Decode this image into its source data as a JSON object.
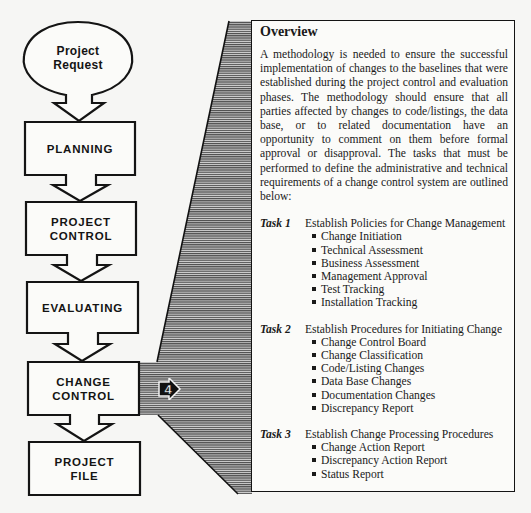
{
  "flowchart": {
    "start": {
      "label_line1": "Project",
      "label_line2": "Request"
    },
    "steps": [
      {
        "line1": "PLANNING",
        "line2": ""
      },
      {
        "line1": "PROJECT",
        "line2": "CONTROL"
      },
      {
        "line1": "EVALUATING",
        "line2": ""
      },
      {
        "line1": "CHANGE",
        "line2": "CONTROL"
      },
      {
        "line1": "PROJECT",
        "line2": "FILE"
      }
    ],
    "highlighted_step": "CHANGE CONTROL",
    "phase_badge": "4"
  },
  "overview": {
    "title": "Overview",
    "paragraph": "A methodology is needed to ensure the suc­cessful implementation of changes to the base­lines that were established during the project control and evaluation phases.  The method­ology should ensure that all parties affected by changes to code/listings, the data base, or to related documentation have an opportunity to comment on them before formal approval or disapproval.  The tasks that must be performed to define the administrative and technical re­quirements of a change control system are out­lined below:",
    "tasks": [
      {
        "label": "Task 1",
        "title": "Establish Policies for Change Management",
        "items": [
          "Change Initiation",
          "Technical Assessment",
          "Business Assessment",
          "Management Approval",
          "Test Tracking",
          "Installation Tracking"
        ]
      },
      {
        "label": "Task 2",
        "title": "Establish Procedures for Initiating Change",
        "items": [
          "Change Control Board",
          "Change Classification",
          "Code/Listing Changes",
          "Data Base Changes",
          "Documentation Changes",
          "Discrepancy Report"
        ]
      },
      {
        "label": "Task 3",
        "title": "Establish Change Processing Procedures",
        "items": [
          "Change Action Report",
          "Discrepancy Action Report",
          "Status Report"
        ]
      }
    ]
  },
  "colors": {
    "ink": "#1a1a1a",
    "paper": "#f6f6f4",
    "hatch": "#5a5a5a"
  }
}
